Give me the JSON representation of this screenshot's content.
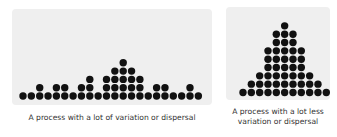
{
  "chart_data": [
    {
      "type": "dot-plot",
      "title": "",
      "caption": "A process with a lot of variation or dispersal",
      "xlabel": "",
      "ylabel": "",
      "grid": false,
      "categories": [
        0,
        1,
        2,
        3,
        4,
        5,
        6,
        7,
        8,
        9,
        10,
        11,
        12,
        13,
        14,
        15,
        16,
        17,
        18,
        19,
        20,
        21
      ],
      "values": [
        1,
        1,
        2,
        1,
        2,
        2,
        1,
        2,
        3,
        1,
        3,
        4,
        5,
        4,
        3,
        1,
        2,
        2,
        1,
        1,
        2,
        1
      ],
      "total": 45,
      "layout": {
        "x0": 23,
        "dx": 8.35,
        "y0": 96,
        "dy": 8.3,
        "r": 3.7
      }
    },
    {
      "type": "dot-plot",
      "title": "",
      "caption": "A process with a lot less variation or dispersal",
      "xlabel": "",
      "ylabel": "",
      "grid": false,
      "categories": [
        0,
        1,
        2,
        3,
        4,
        5,
        6,
        7,
        8,
        9,
        10
      ],
      "values": [
        1,
        2,
        3,
        6,
        8,
        9,
        8,
        6,
        3,
        2,
        1
      ],
      "total": 49,
      "layout": {
        "x0": 243,
        "dx": 8.33,
        "y0": 92.5,
        "dy": 8.33,
        "r": 3.7
      }
    }
  ],
  "captions": {
    "left": "A process with a lot of variation or dispersal",
    "right_line1": "A process with a lot less",
    "right_line2": "variation or dispersal"
  },
  "colors": {
    "dot": "#111111",
    "panel": "#efefef",
    "text": "#333333"
  }
}
